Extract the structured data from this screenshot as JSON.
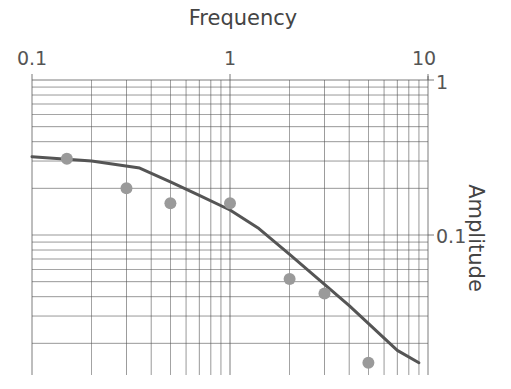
{
  "chart_data": {
    "type": "scatter",
    "title": "Frequency",
    "xlabel": "Frequency",
    "ylabel": "Amplitude",
    "xscale": "log",
    "yscale": "log",
    "xlim": [
      0.1,
      10
    ],
    "ylim": [
      0.0125,
      1
    ],
    "x_axis_position": "top",
    "y_axis_position": "right",
    "grid": true,
    "x_tick_labels": [
      "0.1",
      "1",
      "10"
    ],
    "y_tick_labels": [
      "1",
      "0.1"
    ],
    "series": [
      {
        "name": "Measured",
        "type": "scatter",
        "color": "#9a9a9a",
        "x": [
          0.15,
          0.3,
          0.5,
          1.0,
          2.0,
          3.0,
          5.0
        ],
        "y": [
          0.31,
          0.2,
          0.16,
          0.16,
          0.052,
          0.042,
          0.015
        ]
      },
      {
        "name": "Fit",
        "type": "line",
        "color": "#555555",
        "x": [
          0.1,
          0.2,
          0.35,
          0.5,
          0.7,
          1.0,
          1.4,
          2.0,
          4.0,
          7.0,
          9.0
        ],
        "y": [
          0.32,
          0.3,
          0.27,
          0.22,
          0.18,
          0.145,
          0.11,
          0.075,
          0.035,
          0.018,
          0.015
        ]
      }
    ]
  },
  "labels": {
    "title": "Frequency",
    "ylabel": "Amplitude",
    "xticks": [
      {
        "value": 0.1,
        "label": "0.1"
      },
      {
        "value": 1,
        "label": "1"
      },
      {
        "value": 10,
        "label": "10"
      }
    ],
    "yticks": [
      {
        "value": 1,
        "label": "1"
      },
      {
        "value": 0.1,
        "label": "0.1"
      }
    ]
  },
  "colors": {
    "grid": "#555555",
    "text": "#444444",
    "points": "#9a9a9a",
    "line": "#555555"
  }
}
